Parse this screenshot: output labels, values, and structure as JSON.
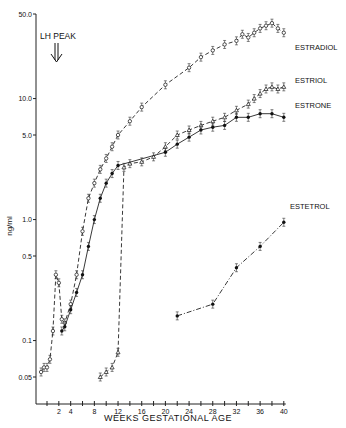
{
  "chart_data": {
    "type": "line",
    "title": "",
    "xlabel": "WEEKS GESTATIONAL AGE",
    "ylabel": "ng/ml",
    "yscale": "log",
    "xlim": [
      0,
      40
    ],
    "ylim": [
      0.05,
      50.0
    ],
    "x_ticks": [
      2,
      4,
      8,
      12,
      16,
      20,
      24,
      28,
      32,
      36,
      40
    ],
    "y_ticks": [
      {
        "value": 50.0,
        "label": "50.0"
      },
      {
        "value": 10.0,
        "label": "10.0"
      },
      {
        "value": 5.0,
        "label": "5.0"
      },
      {
        "value": 1.0,
        "label": "1.0"
      },
      {
        "value": 0.5,
        "label": "0.5"
      },
      {
        "value": 0.1,
        "label": "0.1"
      },
      {
        "value": 0.05,
        "label": "0.05"
      }
    ],
    "grid": false,
    "annotations": [
      {
        "text": "LH PEAK",
        "x": 2,
        "arrow": "double-down"
      }
    ],
    "legend_position": "right-inline",
    "series": [
      {
        "name": "ESTRADIOL",
        "style": "dashed",
        "marker": "open-circle",
        "x": [
          -1,
          -0.5,
          0,
          0.5,
          1,
          1.5,
          2,
          2.5,
          3,
          4,
          5,
          6,
          7,
          8,
          9,
          10,
          11,
          12,
          14,
          16,
          20,
          24,
          26,
          28,
          30,
          32,
          33,
          34,
          35,
          36,
          37,
          38,
          39,
          40
        ],
        "y": [
          0.055,
          0.06,
          0.06,
          0.07,
          0.12,
          0.35,
          0.3,
          0.15,
          0.14,
          0.2,
          0.35,
          0.8,
          1.5,
          2.0,
          2.6,
          3.2,
          4.0,
          5.0,
          6.5,
          8.5,
          13,
          18,
          22,
          25,
          28,
          30,
          34,
          32,
          35,
          38,
          40,
          42,
          38,
          35
        ]
      },
      {
        "name": "ESTRIOL",
        "style": "dashed",
        "marker": "open-triangle",
        "x": [
          9,
          10,
          11,
          12,
          13,
          14,
          16,
          18,
          20,
          22,
          24,
          26,
          28,
          30,
          32,
          34,
          35,
          36,
          37,
          38,
          39,
          40
        ],
        "y": [
          0.05,
          0.055,
          0.06,
          0.08,
          2.7,
          2.9,
          3.0,
          3.3,
          4.0,
          5.0,
          5.5,
          6.0,
          6.5,
          7.0,
          8.0,
          9.0,
          10.0,
          11.0,
          12.0,
          12.5,
          12.0,
          12.5
        ]
      },
      {
        "name": "ESTRONE",
        "style": "solid",
        "marker": "filled-circle",
        "x": [
          2.5,
          3,
          4,
          5,
          6,
          7,
          8,
          9,
          10,
          11,
          12,
          20,
          22,
          24,
          26,
          28,
          30,
          32,
          34,
          36,
          38,
          40
        ],
        "y": [
          0.12,
          0.13,
          0.18,
          0.25,
          0.35,
          0.6,
          1.0,
          1.5,
          2.0,
          2.4,
          2.8,
          3.6,
          4.2,
          4.8,
          5.5,
          5.8,
          6.0,
          7.0,
          7.0,
          7.5,
          7.5,
          7.0
        ]
      },
      {
        "name": "ESTETROL",
        "style": "dash-dot",
        "marker": "filled-circle",
        "x": [
          22,
          28,
          32,
          36,
          40
        ],
        "y": [
          0.16,
          0.2,
          0.4,
          0.6,
          0.95
        ]
      }
    ]
  },
  "labels": {
    "annotation": "LH PEAK",
    "ylabel": "ng/ml",
    "xlabel": "WEEKS GESTATIONAL AGE",
    "legend": [
      "ESTRADIOL",
      "ESTRIOL",
      "ESTRONE",
      "ESTETROL"
    ]
  }
}
